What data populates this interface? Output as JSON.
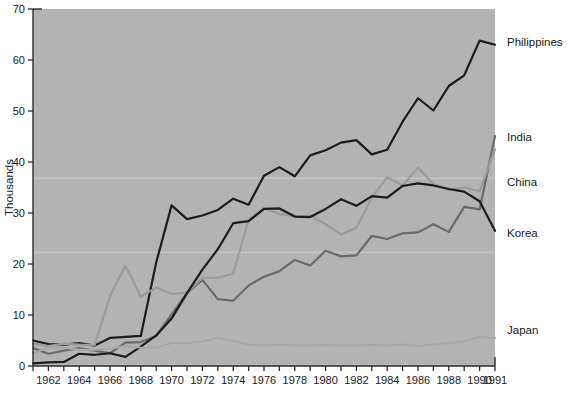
{
  "chart_data": {
    "type": "line",
    "title": "",
    "subtitle": "",
    "xlabel": "",
    "ylabel": "Thousands",
    "xlim": [
      1961,
      1991
    ],
    "ylim": [
      0,
      70
    ],
    "grid": false,
    "legend_position": "right-inline-labels",
    "background_color": "#b3b3b3",
    "plot_border_color": "#2b2b2b",
    "x": [
      1961,
      1962,
      1963,
      1964,
      1965,
      1966,
      1967,
      1968,
      1969,
      1970,
      1971,
      1972,
      1973,
      1974,
      1975,
      1976,
      1977,
      1978,
      1979,
      1980,
      1981,
      1982,
      1983,
      1984,
      1985,
      1986,
      1987,
      1988,
      1989,
      1990,
      1991
    ],
    "x_tick_labels": [
      "1962",
      "1964",
      "1966",
      "1968",
      "1970",
      "1972",
      "1974",
      "1976",
      "1978",
      "1980",
      "1982",
      "1984",
      "1986",
      "1988",
      "1990",
      "1991"
    ],
    "x_tick_values": [
      1962,
      1964,
      1966,
      1968,
      1970,
      1972,
      1974,
      1976,
      1978,
      1980,
      1982,
      1984,
      1986,
      1988,
      1990,
      1991
    ],
    "y_tick_labels": [
      "0",
      "10",
      "20",
      "30",
      "40",
      "50",
      "60",
      "70"
    ],
    "y_tick_values": [
      0,
      10,
      20,
      30,
      40,
      50,
      60,
      70
    ],
    "series": [
      {
        "name": "Philippines",
        "color": "#1c1c1c",
        "width": 2.2,
        "label": "Philippines",
        "values": [
          5.0,
          4.3,
          4.2,
          4.5,
          4.0,
          5.5,
          5.7,
          5.9,
          20.3,
          31.5,
          28.8,
          29.5,
          30.6,
          32.8,
          31.6,
          37.3,
          39.0,
          37.2,
          41.3,
          42.3,
          43.8,
          44.3,
          41.5,
          42.4,
          47.9,
          52.5,
          50.1,
          54.9,
          57.0,
          63.8,
          63.0
        ]
      },
      {
        "name": "India",
        "color": "#6a6a6a",
        "width": 2.2,
        "label": "India",
        "values": [
          3.5,
          2.4,
          3.0,
          3.5,
          3.0,
          2.5,
          4.6,
          4.7,
          5.9,
          10.1,
          14.3,
          16.9,
          13.1,
          12.8,
          15.8,
          17.5,
          18.6,
          20.8,
          19.7,
          22.6,
          21.5,
          21.7,
          25.5,
          24.9,
          26.0,
          26.2,
          27.8,
          26.3,
          31.2,
          30.7,
          45.1
        ]
      },
      {
        "name": "China",
        "color": "#9b9b9b",
        "width": 2.2,
        "label": "China",
        "values": [
          4.4,
          3.9,
          4.4,
          4.2,
          4.1,
          13.7,
          19.7,
          13.6,
          15.4,
          14.1,
          14.4,
          17.3,
          17.3,
          18.1,
          28.7,
          31.0,
          29.8,
          29.3,
          29.5,
          27.8,
          25.8,
          27.1,
          33.0,
          37.0,
          35.4,
          38.9,
          35.7,
          34.5,
          35.0,
          34.3,
          42.5
        ]
      },
      {
        "name": "Korea",
        "color": "#1c1c1c",
        "width": 2.2,
        "label": "Korea",
        "values": [
          0.5,
          0.7,
          0.8,
          2.4,
          2.2,
          2.5,
          1.8,
          3.8,
          6.0,
          9.3,
          14.3,
          18.9,
          22.9,
          28.0,
          28.4,
          30.8,
          30.9,
          29.3,
          29.2,
          30.8,
          32.7,
          31.4,
          33.3,
          33.0,
          35.3,
          35.8,
          35.4,
          34.7,
          34.2,
          32.3,
          26.5
        ]
      },
      {
        "name": "Japan",
        "color": "#a8a8a8",
        "width": 2.0,
        "label": "Japan",
        "values": [
          2.5,
          3.6,
          3.6,
          3.2,
          3.2,
          3.4,
          3.9,
          3.6,
          3.6,
          4.5,
          4.5,
          4.8,
          5.5,
          4.9,
          4.2,
          4.0,
          4.2,
          4.0,
          4.0,
          4.1,
          4.0,
          4.0,
          4.1,
          4.0,
          4.2,
          3.9,
          4.2,
          4.5,
          4.8,
          5.7,
          5.5
        ]
      }
    ],
    "label_positions": [
      {
        "name": "Philippines",
        "y_value": 63.5
      },
      {
        "name": "India",
        "y_value": 45.0
      },
      {
        "name": "China",
        "y_value": 36.0
      },
      {
        "name": "Korea",
        "y_value": 26.0
      },
      {
        "name": "Japan",
        "y_value": 7.0
      }
    ]
  }
}
